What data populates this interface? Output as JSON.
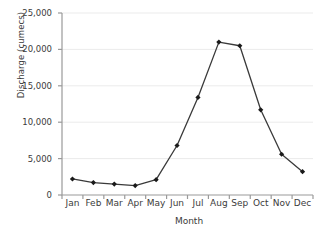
{
  "chart_data": {
    "type": "line",
    "title": "",
    "xlabel": "Month",
    "ylabel": "Discharge (cumecs)",
    "categories": [
      "Jan",
      "Feb",
      "Mar",
      "Apr",
      "May",
      "Jun",
      "Jul",
      "Aug",
      "Sep",
      "Oct",
      "Nov",
      "Dec"
    ],
    "values": [
      2200,
      1700,
      1500,
      1300,
      2100,
      6800,
      13400,
      21000,
      20500,
      11700,
      5600,
      3200
    ],
    "series": [
      {
        "name": "Discharge",
        "values": [
          2200,
          1700,
          1500,
          1300,
          2100,
          6800,
          13400,
          21000,
          20500,
          11700,
          5600,
          3200
        ]
      }
    ],
    "ylim": [
      0,
      25000
    ],
    "yticks": [
      0,
      5000,
      10000,
      15000,
      20000,
      25000
    ],
    "ytick_labels": [
      "0",
      "5,000",
      "10,000",
      "15,000",
      "20,000",
      "25,000"
    ],
    "grid": true,
    "grid_axis": "y",
    "legend": false,
    "marker": "diamond",
    "line_color": "#3a3a3a",
    "marker_color": "#1a1a1a",
    "grid_color": "#ebebeb",
    "axis_color": "#9a9a9a",
    "text_color": "#3b3b3b"
  }
}
